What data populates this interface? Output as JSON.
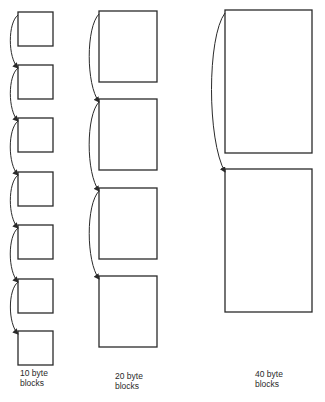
{
  "diagram": {
    "columns": [
      {
        "id": "col-10",
        "label_line1": "10 byte",
        "label_line2": "blocks",
        "block_count": 7,
        "block_x": 18,
        "block_w": 35,
        "block_tops": [
          12,
          65,
          118,
          172,
          225,
          279,
          331
        ],
        "block_h": 34,
        "label_pos": [
          20,
          368
        ]
      },
      {
        "id": "col-20",
        "label_line1": "20 byte",
        "label_line2": "blocks",
        "block_count": 4,
        "block_x": 99,
        "block_w": 58,
        "block_tops": [
          11,
          99,
          188,
          276
        ],
        "block_h": 71,
        "label_pos": [
          115,
          371
        ]
      },
      {
        "id": "col-40",
        "label_line1": "40 byte",
        "label_line2": "blocks",
        "block_count": 2,
        "block_x": 225,
        "block_w": 87,
        "block_tops": [
          10,
          169
        ],
        "block_h": 143,
        "label_pos": [
          255,
          369
        ]
      }
    ],
    "stroke_color": "#2a2a2a",
    "background": "#ffffff"
  }
}
